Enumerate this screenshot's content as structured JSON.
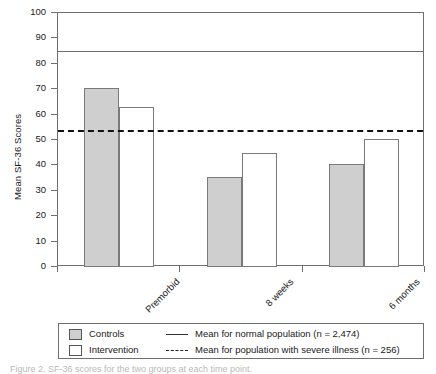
{
  "chart_data": {
    "type": "bar",
    "title": "",
    "xlabel": "",
    "ylabel": "Mean SF-36 Scores",
    "ylim": [
      0,
      100
    ],
    "ytick_step": 10,
    "grid": false,
    "legend_position": "bottom",
    "categories": [
      "Premorbid",
      "8 weeks",
      "6 months"
    ],
    "series": [
      {
        "name": "Controls",
        "values": [
          70.5,
          35.5,
          40.5
        ],
        "fill": "#cfcfcf",
        "border": "#7a7a7a"
      },
      {
        "name": "Intervention",
        "values": [
          63.0,
          45.0,
          50.5
        ],
        "fill": "#ffffff",
        "border": "#7a7a7a"
      }
    ],
    "yticks": [
      "100",
      "90",
      "80",
      "70",
      "60",
      "50",
      "40",
      "30",
      "20",
      "10",
      "0"
    ],
    "ytick_values": [
      100,
      90,
      80,
      70,
      60,
      50,
      40,
      30,
      20,
      10,
      0
    ],
    "reference_lines": [
      {
        "id": "normal",
        "label": "Mean for normal population (n = 2,474)",
        "value": 85,
        "style": "solid",
        "color": "#6f6f6f"
      },
      {
        "id": "severe",
        "label": "Mean for population with severe illness (n = 256)",
        "value": 54,
        "style": "dashed",
        "color": "#111111"
      }
    ]
  },
  "legend": {
    "keys": [
      {
        "label": "Controls",
        "swatch": "fill"
      },
      {
        "label": "Intervention",
        "swatch": "empty"
      }
    ],
    "lines": [
      {
        "label": "Mean for normal population (n = 2,474)",
        "style": "solid"
      },
      {
        "label": "Mean for population with severe illness (n = 256)",
        "style": "dash"
      }
    ]
  },
  "caption": "Figure 2. SF-36 scores for the two groups at each time point."
}
